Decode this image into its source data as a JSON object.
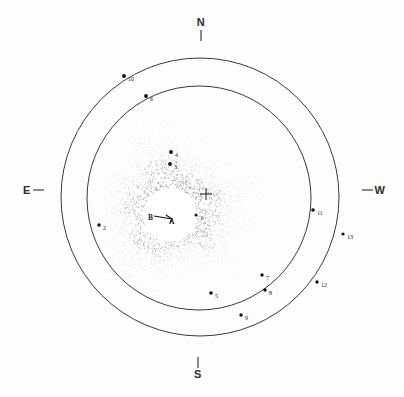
{
  "figure": {
    "background_color": "#fdfdfc",
    "ink_color": "#2c2c2c"
  },
  "cardinals": [
    {
      "name": "north",
      "label": "N",
      "x": 201,
      "y": 26,
      "tick_x1": 201,
      "tick_y1": 30,
      "tick_x2": 201,
      "tick_y2": 41,
      "tick_orientation": "vertical"
    },
    {
      "name": "east",
      "label": "E",
      "x": 27,
      "y": 194,
      "tick_x1": 33,
      "tick_y1": 190,
      "tick_x2": 44,
      "tick_y2": 190,
      "tick_orientation": "horizontal"
    },
    {
      "name": "west",
      "label": "W",
      "x": 380,
      "y": 194,
      "tick_x1": 362,
      "tick_y1": 190,
      "tick_x2": 373,
      "tick_y2": 190,
      "tick_orientation": "horizontal"
    },
    {
      "name": "south",
      "label": "S",
      "x": 198,
      "y": 378,
      "tick_x1": 198,
      "tick_y1": 357,
      "tick_x2": 198,
      "tick_y2": 368,
      "tick_orientation": "vertical"
    }
  ],
  "rings": [
    {
      "name": "outer-ring",
      "cx": 200,
      "cy": 197,
      "r": 139
    },
    {
      "name": "inner-ring",
      "cx": 199,
      "cy": 198,
      "r": 112
    }
  ],
  "nebula": {
    "name": "stippled-coma",
    "cx": 172,
    "cy": 209,
    "outer_radius": 66,
    "dot_color": "#555555",
    "dot_count": 2600
  },
  "occulting_disk": {
    "name": "central-white-disk",
    "cx": 170,
    "cy": 215,
    "r": 27
  },
  "body_labels": [
    {
      "name": "label-B",
      "label": "B",
      "x": 148,
      "y": 220
    },
    {
      "name": "label-A",
      "label": "A",
      "x": 169,
      "y": 224
    }
  ],
  "pointer": {
    "name": "b-to-a-arrow",
    "x1": 154,
    "y1": 216,
    "x2": 172,
    "y2": 219,
    "head1_x": 166,
    "head1_y": 215,
    "head2_x": 170,
    "head2_y": 223
  },
  "reference_cross": {
    "name": "reference-cross-marker",
    "cx": 206,
    "cy": 194,
    "arm": 6
  },
  "stars": [
    {
      "id": 1,
      "label": "1",
      "x": 196,
      "y": 215,
      "lx": 200,
      "ly": 220,
      "r": 1.5
    },
    {
      "id": 2,
      "label": "2",
      "x": 99,
      "y": 225,
      "lx": 103,
      "ly": 230,
      "r": 1.7
    },
    {
      "id": 3,
      "label": "3",
      "x": 170,
      "y": 164,
      "lx": 174,
      "ly": 169,
      "r": 1.9
    },
    {
      "id": 4,
      "label": "4",
      "x": 171,
      "y": 152,
      "lx": 175,
      "ly": 157,
      "r": 1.9
    },
    {
      "id": 5,
      "label": "5",
      "x": 211,
      "y": 293,
      "lx": 215,
      "ly": 298,
      "r": 1.8
    },
    {
      "id": 6,
      "label": "6",
      "x": 146,
      "y": 96,
      "lx": 150,
      "ly": 101,
      "r": 1.9
    },
    {
      "id": 7,
      "label": "7",
      "x": 262,
      "y": 275,
      "lx": 266,
      "ly": 280,
      "r": 1.7
    },
    {
      "id": 8,
      "label": "8",
      "x": 265,
      "y": 290,
      "lx": 269,
      "ly": 295,
      "r": 1.7
    },
    {
      "id": 9,
      "label": "9",
      "x": 241,
      "y": 315,
      "lx": 245,
      "ly": 320,
      "r": 1.7
    },
    {
      "id": 10,
      "label": "10",
      "x": 124,
      "y": 76,
      "lx": 128,
      "ly": 81,
      "r": 1.9
    },
    {
      "id": 11,
      "label": "11",
      "x": 313,
      "y": 210,
      "lx": 317,
      "ly": 215,
      "r": 1.8
    },
    {
      "id": 12,
      "label": "12",
      "x": 317,
      "y": 282,
      "lx": 321,
      "ly": 287,
      "r": 1.7
    },
    {
      "id": 13,
      "label": "13",
      "x": 343,
      "y": 234,
      "lx": 347,
      "ly": 239,
      "r": 1.6
    }
  ]
}
